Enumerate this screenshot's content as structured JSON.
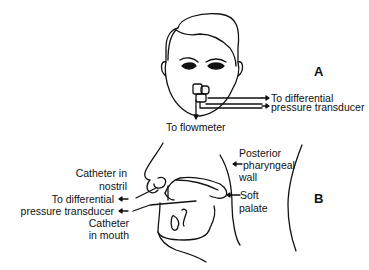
{
  "panels": {
    "a": {
      "letter": "A",
      "labels": {
        "to_differential_1": "To differential",
        "to_differential_2": "pressure transducer",
        "to_flowmeter": "To flowmeter"
      }
    },
    "b": {
      "letter": "B",
      "labels": {
        "catheter_nostril_1": "Catheter in",
        "catheter_nostril_2": "nostril",
        "to_differential_1": "To differential",
        "to_differential_2": "pressure transducer",
        "catheter_mouth_1": "Catheter",
        "catheter_mouth_2": "in mouth",
        "posterior_1": "Posterior",
        "posterior_2": "pharyngeal",
        "posterior_3": "wall",
        "soft_palate_1": "Soft",
        "soft_palate_2": "palate"
      }
    }
  },
  "colors": {
    "line": "#111111",
    "background": "#ffffff"
  }
}
